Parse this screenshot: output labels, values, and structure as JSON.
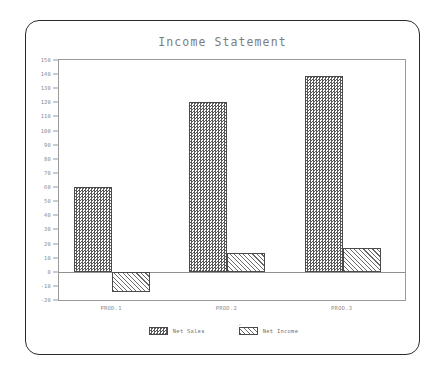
{
  "chart_data": {
    "type": "bar",
    "title": "Income Statement",
    "xlabel": "",
    "ylabel": "",
    "categories": [
      "PROD.1",
      "PROD.2",
      "PROD.3"
    ],
    "series": [
      {
        "name": "Net Sales",
        "values": [
          60,
          120,
          139
        ],
        "pattern": "checkerboard"
      },
      {
        "name": "Net Income",
        "values": [
          -14,
          13,
          17
        ],
        "pattern": "diagonal-hatch"
      }
    ],
    "ylim": [
      -20,
      150
    ],
    "ytick_step": 10,
    "ytick_labels": [
      "150",
      "140",
      "130",
      "120",
      "110",
      "100",
      "90",
      "80",
      "70",
      "60",
      "50",
      "40",
      "30",
      "20",
      "10",
      "0",
      "-10",
      "-20"
    ],
    "grid": false,
    "zero_line": true,
    "legend_position": "bottom-center",
    "colors": {
      "axis": "#9a9a9a",
      "text": "#8a8a8a",
      "title": "#7d7d7d",
      "bar_outline": "#4a4a4a",
      "pattern_fill": "#585858",
      "frame": "#2b2b2b",
      "background": "#ffffff"
    }
  },
  "legend": {
    "items": [
      {
        "label": "Net Sales"
      },
      {
        "label": "Net Income"
      }
    ],
    "artifact_mark": "↗"
  }
}
